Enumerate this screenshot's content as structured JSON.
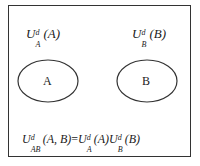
{
  "diagram": {
    "label_a": {
      "base": "U",
      "sup": "d",
      "sub": "A",
      "arg": "(A)"
    },
    "label_b": {
      "base": "U",
      "sup": "d",
      "sub": "B",
      "arg": "(B)"
    },
    "ellipses": [
      {
        "name": "A",
        "label": "A"
      },
      {
        "name": "B",
        "label": "B"
      }
    ],
    "formula": {
      "lhs": {
        "base": "U",
        "sup": "d",
        "sub": "AB",
        "arg": "(A, B)"
      },
      "eq": "=",
      "rhs1": {
        "base": "U",
        "sup": "d",
        "sub": "A",
        "arg": "(A)"
      },
      "rhs2": {
        "base": "U",
        "sup": "d",
        "sub": "B",
        "arg": "(B)"
      }
    },
    "colors": {
      "stroke": "#333333",
      "background": "#ffffff"
    }
  }
}
